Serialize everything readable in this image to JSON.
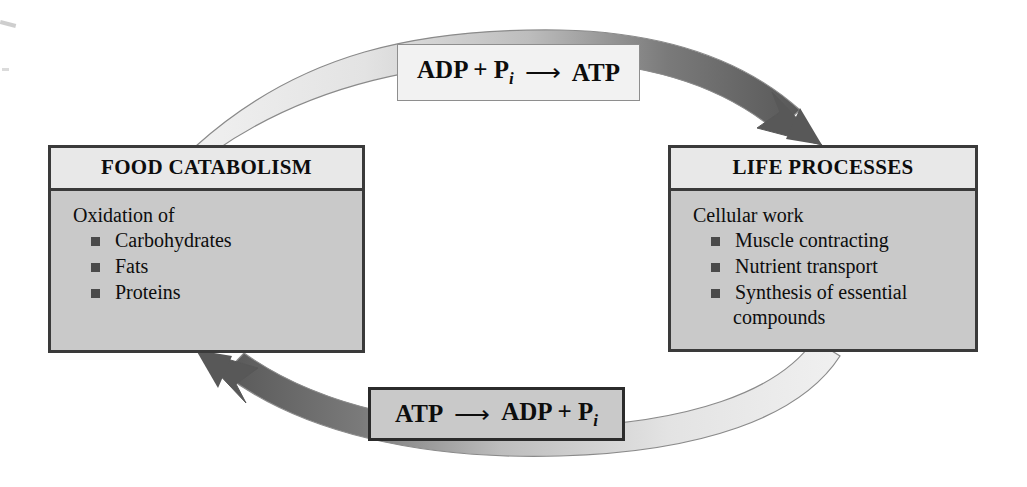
{
  "diagram": {
    "colors": {
      "box_fill": "#c9c9c9",
      "box_header_fill": "#e8e8e8",
      "box_border": "#3a3a3a",
      "arc_dark": "#585858",
      "arc_light": "#e0e0e0",
      "bullet": "#4a4a4a",
      "text": "#0d0d0d",
      "background": "#ffffff"
    }
  },
  "left_box": {
    "header": "FOOD CATABOLISM",
    "intro": "Oxidation of",
    "items": [
      "Carbohydrates",
      "Fats",
      "Proteins"
    ]
  },
  "right_box": {
    "header": "LIFE PROCESSES",
    "intro": "Cellular work",
    "items": [
      "Muscle contracting",
      "Nutrient transport",
      "Synthesis of essential"
    ],
    "item_continuation": "compounds"
  },
  "top_label": {
    "left_term": "ADP + P",
    "left_subscript": "i",
    "arrow": "⟶",
    "right_term": "ATP"
  },
  "bottom_label": {
    "left_term": "ATP",
    "arrow": "⟶",
    "right_term": "ADP + P",
    "right_subscript": "i"
  },
  "arrows": {
    "top_arc_name": "synthesis-arc",
    "bottom_arc_name": "hydrolysis-arc"
  }
}
